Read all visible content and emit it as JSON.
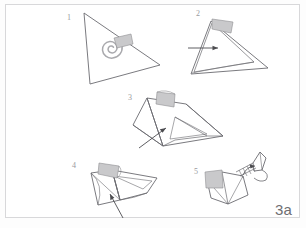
{
  "plate": {
    "label": "3a",
    "border_color": "#d8d8da",
    "background_color": "#ffffff",
    "ink_color": "#6b6b70",
    "flap_fill": "#c9c9cb",
    "spiral_color": "#a9a9ad",
    "width": 306,
    "height": 228
  },
  "steps": [
    {
      "number": "1",
      "caption_text": "1",
      "figure": "triangle-with-spiral-and-flap",
      "has_arrow": false,
      "has_flap": true,
      "has_spiral": true
    },
    {
      "number": "2",
      "caption_text": "2",
      "figure": "triangle-folded-edge-with-flap",
      "has_arrow": true,
      "has_flap": true,
      "has_spiral": false
    },
    {
      "number": "3",
      "caption_text": "3",
      "figure": "three-dimensional-open-fold",
      "has_arrow": true,
      "has_flap": true,
      "has_spiral": false
    },
    {
      "number": "4",
      "caption_text": "4",
      "figure": "compressed-body-fold",
      "has_arrow": true,
      "has_flap": true,
      "has_spiral": false
    },
    {
      "number": "5",
      "caption_text": "5",
      "figure": "finished-bird-form",
      "has_arrow": false,
      "has_flap": true,
      "has_spiral": false
    }
  ]
}
